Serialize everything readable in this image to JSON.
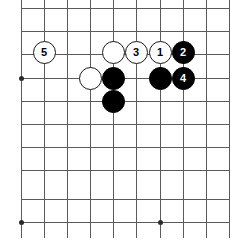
{
  "diagram": {
    "type": "go-board-joseki",
    "title": "",
    "board": {
      "columns": 10,
      "rows": 10,
      "cell_size": 23,
      "origin_x": 21,
      "origin_y": 8,
      "line_color": "#5a5a5a",
      "background_color": "#ffffff",
      "overhang_top": 8,
      "overhang_bottom": 16
    },
    "grid_x": [
      21,
      44,
      67,
      90,
      113,
      136,
      160,
      183,
      206,
      229
    ],
    "grid_y": [
      8,
      31,
      54,
      78,
      101,
      124,
      147,
      170,
      199,
      222
    ],
    "star_points": [
      {
        "name": "star-point-left",
        "x": 21,
        "y": 78
      },
      {
        "name": "star-point-bottom-left",
        "x": 21,
        "y": 222
      },
      {
        "name": "star-point-bottom-center",
        "x": 160,
        "y": 222
      }
    ],
    "stones": [
      {
        "id": "stone-white-5",
        "color": "white",
        "label": "5",
        "x": 44,
        "y": 52
      },
      {
        "id": "stone-white-corner",
        "color": "white",
        "label": "",
        "x": 113,
        "y": 52
      },
      {
        "id": "stone-white-3",
        "color": "white",
        "label": "3",
        "x": 136,
        "y": 52
      },
      {
        "id": "stone-white-1",
        "color": "white",
        "label": "1",
        "x": 160,
        "y": 52
      },
      {
        "id": "stone-black-2",
        "color": "black",
        "label": "2",
        "x": 183,
        "y": 52
      },
      {
        "id": "stone-white-left",
        "color": "white",
        "label": "",
        "x": 90,
        "y": 78
      },
      {
        "id": "stone-black-wall-top",
        "color": "black",
        "label": "",
        "x": 113,
        "y": 78
      },
      {
        "id": "stone-black-right",
        "color": "black",
        "label": "",
        "x": 160,
        "y": 78
      },
      {
        "id": "stone-black-4",
        "color": "black",
        "label": "4",
        "x": 183,
        "y": 78
      },
      {
        "id": "stone-black-wall-bottom",
        "color": "black",
        "label": "",
        "x": 113,
        "y": 101
      }
    ],
    "colors": {
      "black_stone": "#000000",
      "white_stone": "#ffffff",
      "stone_outline": "#1a1a1a",
      "black_label": "#ffffff",
      "white_label": "#000000"
    }
  }
}
